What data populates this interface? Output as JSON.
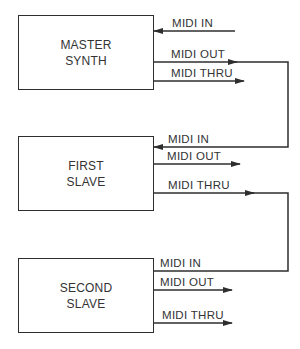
{
  "devices": [
    {
      "id": "master",
      "name_line1": "MASTER",
      "name_line2": "SYNTH",
      "ports": {
        "in": "MIDI IN",
        "out": "MIDI OUT",
        "thru": "MIDI THRU"
      }
    },
    {
      "id": "first",
      "name_line1": "FIRST",
      "name_line2": "SLAVE",
      "ports": {
        "in": "MIDI IN",
        "out": "MIDI OUT",
        "thru": "MIDI THRU"
      }
    },
    {
      "id": "second",
      "name_line1": "SECOND",
      "name_line2": "SLAVE",
      "ports": {
        "in": "MIDI IN",
        "out": "MIDI OUT",
        "thru": "MIDI THRU"
      }
    }
  ],
  "connections": [
    {
      "from": "MASTER SYNTH / MIDI OUT",
      "to": "FIRST SLAVE / MIDI IN"
    },
    {
      "from": "FIRST SLAVE / MIDI THRU",
      "to": "SECOND SLAVE / MIDI IN"
    }
  ],
  "colors": {
    "line": "#2e2e2e",
    "background": "#ffffff"
  }
}
